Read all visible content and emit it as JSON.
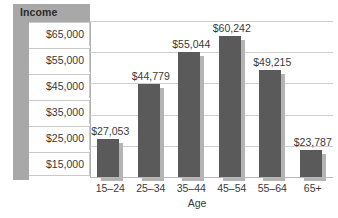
{
  "chart_data": {
    "type": "bar",
    "title": "",
    "legend_label": "Income",
    "xlabel": "Age",
    "ylabel": "",
    "categories": [
      "15–24",
      "25–34",
      "35–44",
      "45–54",
      "55–64",
      "65+"
    ],
    "values": [
      27053,
      44779,
      55044,
      60242,
      49215,
      23787
    ],
    "value_labels": [
      "$27,053",
      "$44,779",
      "$55,044",
      "$60,242",
      "$49,215",
      "$23,787"
    ],
    "ytick_labels": [
      "$65,000",
      "$55,000",
      "$45,000",
      "$35,000",
      "$25,000",
      "$15,000"
    ],
    "ytick_values": [
      65000,
      55000,
      45000,
      35000,
      25000,
      15000
    ],
    "ylim": [
      15000,
      65000
    ],
    "grid": true,
    "legend_position": "top-left",
    "colors": {
      "bar": "#5a5a5a",
      "bar_shadow": "#b4b4b4",
      "axis_band": "#a8a8a8",
      "gridline": "#cfcfcf",
      "text": "#3a3a3a",
      "background": "#ffffff"
    }
  }
}
